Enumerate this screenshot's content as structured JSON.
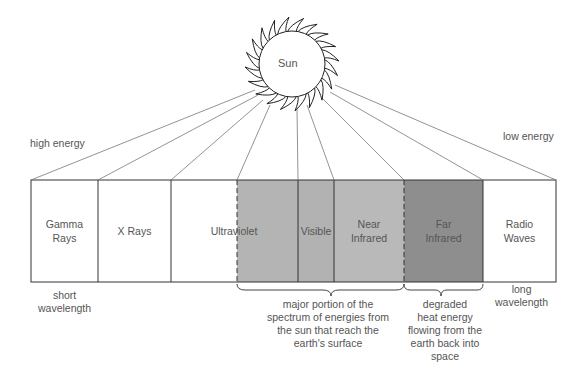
{
  "sun": {
    "label": "Sun"
  },
  "energy_labels": {
    "left": "high energy",
    "right": "low energy"
  },
  "wavelength_labels": {
    "left": [
      "short",
      "wavelength"
    ],
    "right": [
      "long",
      "wavelength"
    ]
  },
  "bands": [
    {
      "name": "Gamma Rays",
      "lines": [
        "Gamma",
        "Rays"
      ],
      "fill": "#ffffff"
    },
    {
      "name": "X Rays",
      "lines": [
        "X Rays"
      ],
      "fill": "#ffffff"
    },
    {
      "name": "Ultraviolet",
      "lines": [
        "Ultraviolet"
      ],
      "fill": "#ffffff"
    },
    {
      "name": "Ultraviolet (shaded)",
      "lines": [
        ""
      ],
      "fill": "#b4b4b4"
    },
    {
      "name": "Visible",
      "lines": [
        "Visible"
      ],
      "fill": "#b4b4b4"
    },
    {
      "name": "Near Infrared",
      "lines": [
        "Near",
        "Infrared"
      ],
      "fill": "#b9b9b9"
    },
    {
      "name": "Far Infrared",
      "lines": [
        "Far",
        "Infrared"
      ],
      "fill": "#8e8e8e"
    },
    {
      "name": "Radio Waves",
      "lines": [
        "Radio",
        "Waves"
      ],
      "fill": "#ffffff"
    }
  ],
  "annotations": {
    "earth_surface": [
      "major portion of the",
      "spectrum of energies from",
      "the sun that reach the",
      "earth's surface"
    ],
    "degraded_heat": [
      "degraded",
      "heat energy",
      "flowing from the",
      "earth back into",
      "space"
    ]
  }
}
